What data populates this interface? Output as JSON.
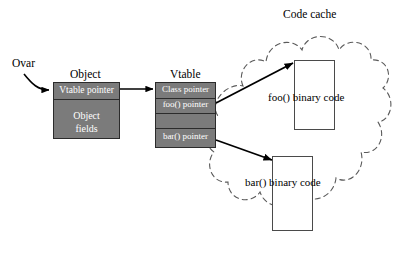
{
  "diagram": {
    "title_code_cache": "Code cache",
    "label_ovar": "Ovar",
    "object": {
      "caption": "Object",
      "rows": [
        "Vtable pointer",
        "Object",
        "fields"
      ]
    },
    "vtable": {
      "caption": "Vtable",
      "rows": [
        "Class pointer",
        "foo() pointer",
        "",
        "bar() pointer"
      ]
    },
    "code_cache": {
      "foo_label": "foo() binary code",
      "bar_label": "bar() binary code"
    },
    "colors": {
      "background": "#ffffff",
      "block_fill": "#7b7b7b",
      "block_stroke": "#2b2b2b",
      "row_text": "#ffffff",
      "text": "#000000",
      "cloud_stroke": "#5a5a5a",
      "arrow": "#000000",
      "codebox_stroke": "#4a4a4a"
    }
  }
}
